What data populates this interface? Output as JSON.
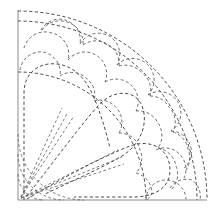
{
  "figure": {
    "background_color": "#ffffff",
    "frame_color": "#8c8c8c",
    "line_color": "#4a4a4a",
    "line_style": "dashed",
    "width": 221,
    "height": 215
  },
  "geometry": {
    "origin": {
      "x": 18,
      "y": 200
    },
    "frame": {
      "left": 18,
      "top": 10,
      "right": 207,
      "bottom": 200
    },
    "radii": {
      "outer_arc": 189,
      "scale_band_inner": 128,
      "petal_band_outer": 122,
      "corner_arc_1": 26,
      "corner_arc_2": 46,
      "corner_arc_3": 66
    },
    "sectors": 3,
    "scale_rows": 3
  },
  "labels": {
    "frame": "pattern-frame",
    "outer_arc": "outer-quarter-arc",
    "scale_band": "scale-motif-band",
    "petals": "teardrop-petal-group",
    "spokes": "radial-spoke-lines",
    "corner_arcs": "corner-concentric-arcs"
  },
  "elements": {
    "petal_count": 3,
    "spoke_count": 6,
    "scale_circle_count": 24
  }
}
